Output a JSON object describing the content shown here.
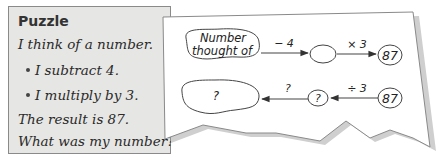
{
  "puzzle": {
    "title": "Puzzle",
    "lines": [
      "I think of a number.",
      "I subtract 4.",
      "I multiply by 3.",
      "The result is 87.",
      "What was my number?"
    ]
  },
  "diagram": {
    "forward": {
      "start_label_line1": "Number",
      "start_label_line2": "thought of",
      "op1": "− 4",
      "middle": "",
      "op2": "× 3",
      "end": "87"
    },
    "backward": {
      "start": "87",
      "op1": "÷ 3",
      "middle": "?",
      "op2": "?",
      "end": "?"
    }
  }
}
